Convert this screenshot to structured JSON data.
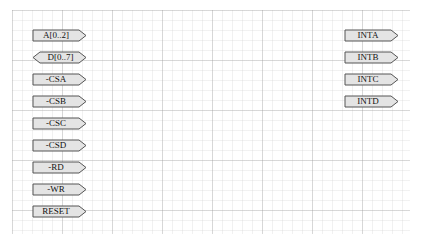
{
  "sheet": {
    "grid": "on"
  },
  "colors": {
    "port_fill": "#e4e4e4",
    "port_stroke": "#555555",
    "text": "#111111"
  },
  "left_ports": [
    {
      "label": "A[0..2]",
      "type": "output"
    },
    {
      "label": "D[0..7]",
      "type": "bidirectional"
    },
    {
      "label": "-CSA",
      "type": "output"
    },
    {
      "label": "-CSB",
      "type": "output"
    },
    {
      "label": "-CSC",
      "type": "output"
    },
    {
      "label": "-CSD",
      "type": "output"
    },
    {
      "label": "-RD",
      "type": "output"
    },
    {
      "label": "-WR",
      "type": "output"
    },
    {
      "label": "RESET",
      "type": "output"
    }
  ],
  "right_ports": [
    {
      "label": "INTA",
      "type": "output"
    },
    {
      "label": "INTB",
      "type": "output"
    },
    {
      "label": "INTC",
      "type": "output"
    },
    {
      "label": "INTD",
      "type": "output"
    }
  ]
}
